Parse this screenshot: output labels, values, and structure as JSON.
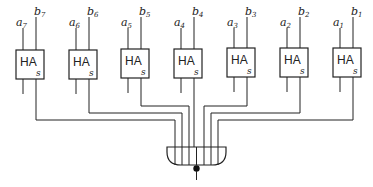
{
  "diagram": {
    "type": "circuit",
    "colors": {
      "stroke": "#222222",
      "background": "#ffffff"
    },
    "half_adders": [
      {
        "id": "ha7",
        "label": "HA",
        "output": "s",
        "input_a": "a",
        "a_sub": "7",
        "input_b": "b",
        "b_sub": "7"
      },
      {
        "id": "ha6",
        "label": "HA",
        "output": "s",
        "input_a": "a",
        "a_sub": "6",
        "input_b": "b",
        "b_sub": "6"
      },
      {
        "id": "ha5",
        "label": "HA",
        "output": "s",
        "input_a": "a",
        "a_sub": "5",
        "input_b": "b",
        "b_sub": "5"
      },
      {
        "id": "ha4",
        "label": "HA",
        "output": "s",
        "input_a": "a",
        "a_sub": "4",
        "input_b": "b",
        "b_sub": "4"
      },
      {
        "id": "ha3",
        "label": "HA",
        "output": "s",
        "input_a": "a",
        "a_sub": "3",
        "input_b": "b",
        "b_sub": "3"
      },
      {
        "id": "ha2",
        "label": "HA",
        "output": "s",
        "input_a": "a",
        "a_sub": "2",
        "input_b": "b",
        "b_sub": "2"
      },
      {
        "id": "ha1",
        "label": "HA",
        "output": "s",
        "input_a": "a",
        "a_sub": "1",
        "input_b": "b",
        "b_sub": "1"
      }
    ],
    "gate": {
      "type": "and-gate-inverted-output",
      "inputs": 7
    }
  }
}
